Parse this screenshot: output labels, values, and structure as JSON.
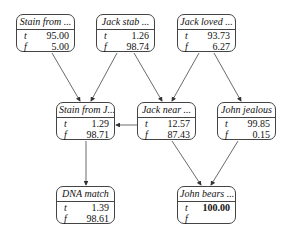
{
  "nodes": [
    {
      "id": "stain_from",
      "title": "Stain from ...",
      "t": "95.00",
      "f": "5.00"
    },
    {
      "id": "jack_stab",
      "title": "Jack stab ...",
      "t": "1.26",
      "f": "98.74"
    },
    {
      "id": "jack_loved",
      "title": "Jack loved ...",
      "t": "93.73",
      "f": "6.27"
    },
    {
      "id": "stain_from_j",
      "title": "Stain from J...",
      "t": "1.29",
      "f": "98.71"
    },
    {
      "id": "jack_near",
      "title": "Jack near ...",
      "t": "12.57",
      "f": "87.43"
    },
    {
      "id": "john_jealous",
      "title": "John jealous",
      "t": "99.85",
      "f": "0.15"
    },
    {
      "id": "dna_match",
      "title": "DNA match",
      "t": "1.39",
      "f": "98.61"
    },
    {
      "id": "john_bears",
      "title": "John bears ...",
      "t": "100.00",
      "f": ""
    }
  ],
  "labels": {
    "t": "t",
    "f": "f"
  },
  "edges": [
    [
      "stain_from",
      "stain_from_j"
    ],
    [
      "jack_stab",
      "stain_from_j"
    ],
    [
      "jack_stab",
      "jack_near"
    ],
    [
      "jack_loved",
      "jack_near"
    ],
    [
      "jack_loved",
      "john_jealous"
    ],
    [
      "jack_near",
      "stain_from_j"
    ],
    [
      "stain_from_j",
      "dna_match"
    ],
    [
      "jack_near",
      "john_bears"
    ],
    [
      "john_jealous",
      "john_bears"
    ]
  ],
  "colors": {
    "line": "#444444",
    "text": "#111111",
    "background": "#ffffff"
  }
}
